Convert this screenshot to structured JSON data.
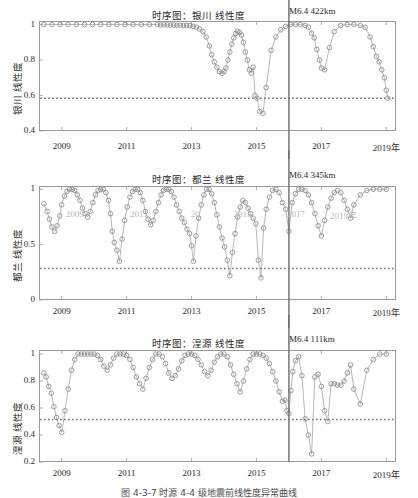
{
  "figure": {
    "caption": "图 4-3-7  时源 4-4 级地震前线性度异常曲线",
    "width": 418,
    "height": 498
  },
  "style": {
    "marker_color": "#8c8c8c",
    "line_color": "#9a9a9a",
    "threshold_color": "#6f6f6f",
    "event_line_color": "#6d6d6d",
    "axis_color": "#9a9a9a",
    "text_color": "#2b2b2b"
  },
  "axis": {
    "xlabel_suffix": "年",
    "xticks": [
      "2009",
      "2011",
      "2013",
      "2015",
      "2017",
      "2019年"
    ],
    "xtick_values": [
      2009,
      2011,
      2013,
      2015,
      2017,
      2019
    ],
    "xlim": [
      2008.3,
      2019.3
    ]
  },
  "ghost_labels": [
    {
      "text": "2009",
      "x": 0.075,
      "y": 0.2
    },
    {
      "text": "2011",
      "x": 0.255,
      "y": 0.2
    },
    {
      "text": "20",
      "x": 0.425,
      "y": 0.2
    },
    {
      "text": "2013",
      "x": 0.545,
      "y": 0.2
    },
    {
      "text": "2017",
      "x": 0.695,
      "y": 0.2
    },
    {
      "text": "2019年",
      "x": 0.815,
      "y": 0.2
    }
  ],
  "chart_data": [
    {
      "type": "line",
      "panel": 1,
      "title": "时序图：银川 线性度",
      "event_label": "M6.4 422km",
      "event_magnitude": "M6.4",
      "event_distance_km": 422,
      "event_x": 2016.0,
      "ylabel": "银川 线性度",
      "xlabel": "",
      "yticks": [
        1,
        0.8,
        0.6,
        0.4
      ],
      "ylim": [
        0.4,
        1.02
      ],
      "threshold": 0.585,
      "grid": false,
      "legend": "none",
      "x": [
        2008.45,
        2008.7,
        2008.95,
        2009.2,
        2009.45,
        2009.7,
        2009.95,
        2010.2,
        2010.45,
        2010.7,
        2010.95,
        2011.2,
        2011.45,
        2011.7,
        2011.95,
        2012.05,
        2012.15,
        2012.25,
        2012.35,
        2012.45,
        2012.55,
        2012.65,
        2012.75,
        2012.85,
        2012.95,
        2013.05,
        2013.15,
        2013.25,
        2013.35,
        2013.45,
        2013.55,
        2013.62,
        2013.7,
        2013.78,
        2013.86,
        2013.94,
        2014.0,
        2014.06,
        2014.12,
        2014.18,
        2014.24,
        2014.3,
        2014.36,
        2014.42,
        2014.48,
        2014.54,
        2014.6,
        2014.66,
        2014.72,
        2014.78,
        2014.84,
        2014.9,
        2014.96,
        2015.02,
        2015.1,
        2015.2,
        2015.3,
        2015.45,
        2015.6,
        2015.75,
        2015.9,
        2016.05,
        2016.2,
        2016.35,
        2016.5,
        2016.6,
        2016.7,
        2016.78,
        2016.86,
        2016.94,
        2017.0,
        2017.1,
        2017.25,
        2017.4,
        2017.6,
        2017.8,
        2018.0,
        2018.2,
        2018.35,
        2018.5,
        2018.6,
        2018.7,
        2018.78,
        2018.86,
        2018.94,
        2019.0,
        2019.05
      ],
      "y": [
        1.0,
        1.0,
        1.0,
        1.0,
        1.0,
        1.0,
        1.0,
        1.0,
        1.0,
        1.0,
        1.0,
        1.0,
        1.0,
        1.0,
        1.0,
        0.998,
        0.998,
        0.998,
        0.997,
        0.997,
        0.996,
        0.996,
        0.995,
        0.995,
        0.994,
        0.99,
        0.985,
        0.975,
        0.96,
        0.93,
        0.88,
        0.83,
        0.79,
        0.76,
        0.735,
        0.725,
        0.735,
        0.755,
        0.8,
        0.845,
        0.89,
        0.925,
        0.95,
        0.962,
        0.955,
        0.94,
        0.9,
        0.845,
        0.8,
        0.745,
        0.725,
        0.76,
        0.6,
        0.585,
        0.51,
        0.5,
        0.645,
        0.855,
        0.93,
        0.97,
        0.99,
        1.0,
        1.0,
        1.0,
        0.995,
        0.985,
        0.95,
        0.925,
        0.86,
        0.8,
        0.755,
        0.745,
        0.87,
        0.96,
        0.995,
        1.0,
        1.0,
        0.995,
        0.985,
        0.93,
        0.875,
        0.82,
        0.79,
        0.745,
        0.7,
        0.63,
        0.585
      ]
    },
    {
      "type": "line",
      "panel": 2,
      "title": "时序图：都兰 线性度",
      "event_label": "M6.4 345km",
      "event_magnitude": "M6.4",
      "event_distance_km": 345,
      "event_x": 2016.0,
      "ylabel": "都兰 线性度",
      "xlabel": "",
      "yticks": [
        1,
        0.5,
        0
      ],
      "ylim": [
        0,
        1.03
      ],
      "threshold": 0.285,
      "grid": false,
      "legend": "none",
      "x": [
        2008.45,
        2008.55,
        2008.62,
        2008.7,
        2008.78,
        2008.86,
        2008.94,
        2009.0,
        2009.08,
        2009.16,
        2009.24,
        2009.32,
        2009.4,
        2009.48,
        2009.56,
        2009.64,
        2009.72,
        2009.8,
        2009.88,
        2009.96,
        2010.04,
        2010.12,
        2010.2,
        2010.28,
        2010.36,
        2010.44,
        2010.5,
        2010.56,
        2010.62,
        2010.7,
        2010.78,
        2010.86,
        2010.94,
        2011.02,
        2011.1,
        2011.18,
        2011.26,
        2011.34,
        2011.42,
        2011.5,
        2011.58,
        2011.66,
        2011.74,
        2011.82,
        2011.9,
        2011.98,
        2012.06,
        2012.14,
        2012.22,
        2012.3,
        2012.38,
        2012.46,
        2012.54,
        2012.62,
        2012.7,
        2012.78,
        2012.86,
        2012.94,
        2013.0,
        2013.06,
        2013.14,
        2013.22,
        2013.3,
        2013.38,
        2013.46,
        2013.54,
        2013.62,
        2013.7,
        2013.78,
        2013.86,
        2013.94,
        2014.02,
        2014.1,
        2014.18,
        2014.26,
        2014.34,
        2014.42,
        2014.5,
        2014.58,
        2014.66,
        2014.74,
        2014.82,
        2014.9,
        2014.98,
        2015.06,
        2015.14,
        2015.22,
        2015.3,
        2015.4,
        2015.5,
        2015.6,
        2015.7,
        2015.8,
        2015.9,
        2016.0,
        2016.1,
        2016.2,
        2016.3,
        2016.4,
        2016.5,
        2016.6,
        2016.7,
        2016.8,
        2016.9,
        2017.0,
        2017.1,
        2017.2,
        2017.3,
        2017.4,
        2017.5,
        2017.6,
        2017.7,
        2017.8,
        2017.9,
        2018.0,
        2018.2,
        2018.4,
        2018.6,
        2018.8,
        2019.0
      ],
      "y": [
        0.87,
        0.8,
        0.73,
        0.66,
        0.62,
        0.67,
        0.76,
        0.86,
        0.94,
        0.98,
        1.0,
        1.0,
        0.99,
        0.95,
        0.9,
        0.83,
        0.78,
        0.75,
        0.8,
        0.88,
        0.95,
        0.99,
        1.0,
        1.0,
        0.97,
        0.9,
        0.78,
        0.62,
        0.52,
        0.45,
        0.35,
        0.55,
        0.72,
        0.84,
        0.93,
        0.98,
        1.0,
        1.0,
        0.97,
        0.9,
        0.8,
        0.73,
        0.68,
        0.72,
        0.8,
        0.88,
        0.95,
        0.99,
        1.0,
        1.0,
        0.98,
        0.93,
        0.86,
        0.8,
        0.74,
        0.7,
        0.64,
        0.6,
        0.49,
        0.35,
        0.58,
        0.74,
        0.86,
        0.95,
        1.0,
        1.0,
        0.96,
        0.88,
        0.77,
        0.66,
        0.56,
        0.48,
        0.36,
        0.22,
        0.43,
        0.6,
        0.75,
        0.84,
        0.9,
        0.88,
        0.83,
        0.78,
        0.74,
        0.69,
        0.36,
        0.2,
        0.65,
        0.82,
        0.93,
        0.99,
        1.0,
        0.97,
        0.88,
        0.82,
        0.62,
        0.88,
        0.96,
        1.0,
        1.0,
        0.99,
        0.95,
        0.88,
        0.78,
        0.67,
        0.58,
        0.72,
        0.84,
        0.92,
        0.97,
        0.99,
        0.97,
        0.9,
        0.82,
        0.74,
        0.86,
        0.95,
        0.99,
        1.0,
        1.0,
        1.0
      ]
    },
    {
      "type": "line",
      "panel": 3,
      "title": "时序图：湟源 线性度",
      "event_label": "M6.4 111km",
      "event_magnitude": "M6.4",
      "event_distance_km": 111,
      "event_x": 2016.0,
      "ylabel": "湟源 线性度",
      "xlabel": "",
      "yticks": [
        1,
        0.8,
        0.6,
        0.4,
        0.2
      ],
      "ylim": [
        0.2,
        1.03
      ],
      "threshold": 0.515,
      "grid": false,
      "legend": "none",
      "x": [
        2008.45,
        2008.52,
        2008.6,
        2008.68,
        2008.76,
        2008.84,
        2008.92,
        2009.0,
        2009.1,
        2009.2,
        2009.3,
        2009.4,
        2009.5,
        2009.6,
        2009.7,
        2009.8,
        2009.9,
        2010.0,
        2010.1,
        2010.2,
        2010.3,
        2010.4,
        2010.5,
        2010.6,
        2010.7,
        2010.8,
        2010.9,
        2011.0,
        2011.1,
        2011.2,
        2011.3,
        2011.4,
        2011.5,
        2011.6,
        2011.7,
        2011.8,
        2011.9,
        2012.0,
        2012.1,
        2012.2,
        2012.3,
        2012.4,
        2012.5,
        2012.6,
        2012.7,
        2012.8,
        2012.9,
        2013.0,
        2013.1,
        2013.2,
        2013.3,
        2013.4,
        2013.5,
        2013.6,
        2013.7,
        2013.8,
        2013.9,
        2014.0,
        2014.1,
        2014.2,
        2014.3,
        2014.4,
        2014.5,
        2014.6,
        2014.7,
        2014.8,
        2014.9,
        2015.0,
        2015.1,
        2015.2,
        2015.3,
        2015.4,
        2015.5,
        2015.6,
        2015.7,
        2015.8,
        2015.88,
        2015.94,
        2016.0,
        2016.06,
        2016.12,
        2016.2,
        2016.3,
        2016.4,
        2016.5,
        2016.6,
        2016.7,
        2016.8,
        2016.9,
        2017.0,
        2017.1,
        2017.2,
        2017.3,
        2017.4,
        2017.5,
        2017.6,
        2017.7,
        2017.8,
        2017.9,
        2018.0,
        2018.2,
        2018.4,
        2018.6,
        2018.8,
        2019.0
      ],
      "y": [
        0.86,
        0.83,
        0.76,
        0.71,
        0.61,
        0.53,
        0.47,
        0.42,
        0.58,
        0.74,
        0.88,
        0.96,
        1.0,
        1.0,
        1.0,
        1.0,
        1.0,
        1.0,
        0.99,
        0.96,
        0.91,
        0.88,
        0.92,
        0.97,
        1.0,
        1.0,
        1.0,
        0.99,
        0.96,
        0.9,
        0.83,
        0.78,
        0.74,
        0.82,
        0.9,
        0.96,
        1.0,
        1.0,
        0.98,
        0.93,
        0.86,
        0.82,
        0.84,
        0.89,
        0.95,
        0.99,
        1.0,
        1.0,
        0.99,
        0.96,
        0.92,
        0.87,
        0.84,
        0.88,
        0.94,
        0.98,
        1.0,
        1.0,
        0.98,
        0.92,
        0.85,
        0.78,
        0.72,
        0.8,
        0.89,
        0.96,
        1.0,
        1.0,
        1.0,
        0.99,
        0.97,
        0.93,
        0.87,
        0.8,
        0.72,
        0.65,
        0.66,
        0.58,
        0.56,
        0.73,
        0.87,
        0.95,
        0.98,
        0.84,
        0.52,
        0.4,
        0.26,
        0.83,
        0.85,
        0.76,
        0.58,
        0.5,
        0.78,
        0.78,
        0.77,
        0.77,
        0.8,
        0.86,
        0.92,
        0.74,
        0.63,
        0.88,
        0.96,
        1.0,
        1.0
      ]
    }
  ]
}
